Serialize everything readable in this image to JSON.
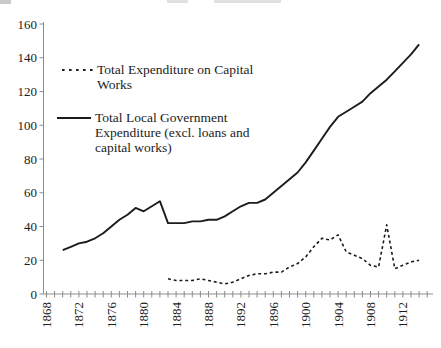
{
  "figure": {
    "background": "#ffffff",
    "axis_color": "#8c8c8c",
    "line_color": "#1c1c1c",
    "tick_label_color": "#1c1c1c"
  },
  "legend": {
    "items": [
      {
        "label": "Total Expenditure on Capital Works",
        "style": "dashed",
        "lines": [
          "Total Expenditure on Capital",
          "Works"
        ]
      },
      {
        "label": "Total Local Government Expenditure (excl. loans and capital works)",
        "style": "solid",
        "lines": [
          "Total Local Government",
          "Expenditure (excl. loans and",
          "capital works)"
        ]
      }
    ]
  },
  "chart_data": {
    "type": "line",
    "title": "",
    "xlabel": "",
    "ylabel": "",
    "grid": false,
    "legend_position": "inside-top-left",
    "x_axis": {
      "first_year": 1868,
      "last_tick_year": 1915,
      "tick_interval": 1,
      "label_interval": 4,
      "label_years": [
        1868,
        1872,
        1876,
        1880,
        1884,
        1888,
        1892,
        1896,
        1900,
        1904,
        1908,
        1912
      ],
      "labels_rotated_degrees": 90
    },
    "y_axis": {
      "min": 0,
      "max": 160,
      "tick_step": 20,
      "tick_labels": [
        "0",
        "20",
        "40",
        "60",
        "80",
        "100",
        "120",
        "140",
        "160"
      ]
    },
    "series": [
      {
        "name": "Total Expenditure on Capital Works",
        "style": "dashed",
        "start_year": 1883,
        "values": [
          9,
          8,
          8,
          8,
          9,
          8,
          7,
          6,
          7,
          9,
          11,
          12,
          12,
          13,
          13,
          16,
          18,
          22,
          28,
          33,
          32,
          35,
          25,
          23,
          21,
          17,
          16,
          41,
          15,
          17,
          19,
          20
        ]
      },
      {
        "name": "Total Local Government Expenditure (excl. loans and capital works)",
        "style": "solid",
        "start_year": 1870,
        "values": [
          26,
          28,
          30,
          31,
          33,
          36,
          40,
          44,
          47,
          51,
          49,
          52,
          55,
          42,
          42,
          42,
          43,
          43,
          44,
          44,
          46,
          49,
          52,
          54,
          54,
          56,
          60,
          64,
          68,
          72,
          78,
          85,
          92,
          99,
          105,
          108,
          111,
          114,
          119,
          123,
          127,
          132,
          137,
          142,
          148
        ]
      }
    ]
  }
}
